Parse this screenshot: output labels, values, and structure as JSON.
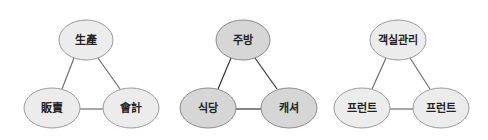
{
  "diagrams": [
    {
      "name": "production-sales-accounting",
      "fill": "#ececec",
      "stroke": "#9a9a9a",
      "edge_color": "#6e6e6e",
      "nodes": [
        {
          "label": "生產",
          "cx": 86,
          "cy": 40
        },
        {
          "label": "販賣",
          "cx": 52,
          "cy": 108
        },
        {
          "label": "會計",
          "cx": 131,
          "cy": 108
        }
      ]
    },
    {
      "name": "kitchen-restaurant-cashier",
      "fill": "#d6d6d6",
      "stroke": "#8a8a8a",
      "edge_color": "#333333",
      "nodes": [
        {
          "label": "주방",
          "cx": 243,
          "cy": 40
        },
        {
          "label": "식당",
          "cx": 208,
          "cy": 108
        },
        {
          "label": "캐셔",
          "cx": 289,
          "cy": 108
        }
      ]
    },
    {
      "name": "room-management-front",
      "fill": "#ececec",
      "stroke": "#9a9a9a",
      "edge_color": "#6e6e6e",
      "nodes": [
        {
          "label": "객실관리",
          "cx": 398,
          "cy": 40
        },
        {
          "label": "프런트",
          "cx": 362,
          "cy": 108
        },
        {
          "label": "프런트",
          "cx": 441,
          "cy": 108
        }
      ]
    }
  ]
}
